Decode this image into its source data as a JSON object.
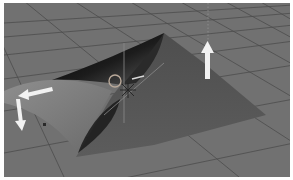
{
  "viewport": {
    "label": "3D viewport",
    "background": "#6f6f6f",
    "grid": {
      "visible": true,
      "floor_color": "#717171",
      "line_color": "#4a4a4a"
    }
  },
  "scene": {
    "object": {
      "name": "curled-plane-mesh",
      "surface_color": "#555555",
      "shadow_color": "#0e0e0e",
      "highlight_color": "#8a8a8a"
    },
    "pivot": {
      "shape": "circle",
      "color": "#b9a99a"
    },
    "manipulator": {
      "color": "#d8d8d8"
    }
  },
  "overlays": {
    "arrow_up": {
      "direction": "up",
      "color": "#f2f2f2"
    },
    "arrow_left": {
      "direction": "left",
      "color": "#f2f2f2"
    },
    "arrow_down": {
      "direction": "down",
      "color": "#f2f2f2"
    }
  }
}
